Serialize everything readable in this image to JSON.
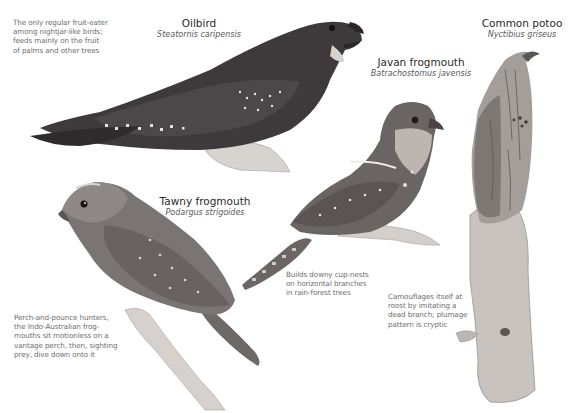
{
  "species": [
    {
      "id": "oilbird",
      "common_name": "Oilbird",
      "scientific_name": "Steatornis caripensis",
      "caption": [
        "The only regular fruit-eater",
        "among nightjar-like birds;",
        "feeds mainly on the fruit",
        "of palms and other trees"
      ]
    },
    {
      "id": "javan-frogmouth",
      "common_name": "Javan frogmouth",
      "scientific_name": "Batrachostomus javensis",
      "caption": [
        "Builds downy cup-nests",
        "on horizontal branches",
        "in rain-forest trees"
      ]
    },
    {
      "id": "common-potoo",
      "common_name": "Common potoo",
      "scientific_name": "Nyctibius griseus",
      "caption": [
        "Camouflages itself at",
        "roost by imitating a",
        "dead branch; plumage",
        "pattern is cryptic"
      ]
    },
    {
      "id": "tawny-frogmouth",
      "common_name": "Tawny frogmouth",
      "scientific_name": "Podargus strigoides",
      "caption": [
        "Perch-and-pounce hunters,",
        "the Indo-Australian frog-",
        "mouths sit motionless on a",
        "vantage perch, then, sighting",
        "prey, dive down onto it"
      ]
    }
  ],
  "colors": {
    "background": "#ffffff",
    "caption_text": "#6e6e6e",
    "name_text": "#2a2a2a",
    "oilbird_plumage": "#3e3a3c",
    "frogmouth_plumage": "#6a6462",
    "potoo_plumage": "#9a9590",
    "branch": "#c9c4bf"
  }
}
